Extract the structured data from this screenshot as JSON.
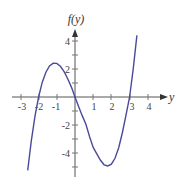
{
  "chart_data": {
    "type": "line",
    "title": "",
    "xlabel": "y",
    "ylabel": "f(y)",
    "x_ticks": [
      "-3",
      "-2",
      "-1",
      "1",
      "2",
      "3",
      "4"
    ],
    "y_ticks": [
      "4",
      "2",
      "-2",
      "-4"
    ],
    "xlim": [
      -3.4,
      4.9
    ],
    "ylim": [
      -5.7,
      4.9
    ],
    "grid": false,
    "legend": null,
    "series": [
      {
        "name": "f(y)",
        "color": "#4a4a9a",
        "x": [
          -2.6,
          -2.4,
          -2.2,
          -2.0,
          -1.8,
          -1.6,
          -1.4,
          -1.2,
          -1.0,
          -0.8,
          -0.6,
          -0.4,
          -0.2,
          0.0,
          0.2,
          0.4,
          0.6,
          0.8,
          1.0,
          1.2,
          1.4,
          1.6,
          1.8,
          2.0,
          2.2,
          2.4,
          2.6,
          2.8,
          3.0,
          3.2,
          3.4
        ],
        "y": [
          -5.24,
          -3.13,
          -1.37,
          0.0,
          1.04,
          1.77,
          2.22,
          2.42,
          2.4,
          2.19,
          1.81,
          1.31,
          0.71,
          0.0,
          -0.67,
          -1.35,
          -1.94,
          -2.84,
          -3.6,
          -4.06,
          -4.52,
          -4.84,
          -4.92,
          -4.8,
          -4.38,
          -3.62,
          -2.57,
          -1.3,
          0.0,
          1.99,
          4.41
        ]
      }
    ],
    "roots": [
      -2,
      0,
      3
    ],
    "local_max": {
      "x": -1.1,
      "y": 2.4
    },
    "local_min": {
      "x": 1.8,
      "y": -4.9
    }
  }
}
